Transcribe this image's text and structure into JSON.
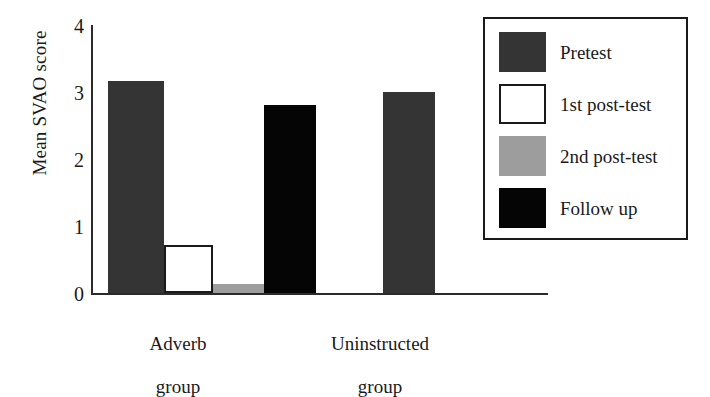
{
  "chart_data": {
    "type": "bar",
    "title": "",
    "xlabel": "",
    "ylabel": "Mean SVAO score",
    "ylim": [
      0,
      4
    ],
    "yticks": [
      "0",
      "1",
      "2",
      "3",
      "4"
    ],
    "grid": false,
    "legend_position": "right",
    "categories": [
      "Adverb group",
      "Uninstructed group"
    ],
    "category_labels_multiline": [
      [
        "Adverb",
        "group"
      ],
      [
        "Uninstructed",
        "group"
      ]
    ],
    "series": [
      {
        "name": "Pretest",
        "color": "#343434",
        "values": [
          3.17,
          3.0
        ]
      },
      {
        "name": "1st post-test",
        "color": "#ffffff",
        "values": [
          0.72,
          null
        ]
      },
      {
        "name": "2nd post-test",
        "color": "#9d9d9d",
        "values": [
          0.13,
          null
        ]
      },
      {
        "name": "Follow up",
        "color": "#050505",
        "values": [
          2.8,
          null
        ]
      }
    ]
  },
  "legend": {
    "entries": [
      {
        "label": "Pretest",
        "swatch": "pretest-swatch"
      },
      {
        "label": "1st post-test",
        "swatch": "post1-swatch"
      },
      {
        "label": "2nd post-test",
        "swatch": "post2-swatch"
      },
      {
        "label": "Follow up",
        "swatch": "follow-up-swatch"
      }
    ]
  },
  "axis": {
    "y_title": "Mean SVAO score",
    "ticks": [
      {
        "value": "4"
      },
      {
        "value": "3"
      },
      {
        "value": "2"
      },
      {
        "value": "1"
      },
      {
        "value": "0"
      }
    ]
  },
  "groups": [
    {
      "line1": "Adverb",
      "line2": "group"
    },
    {
      "line1": "Uninstructed",
      "line2": "group"
    }
  ]
}
